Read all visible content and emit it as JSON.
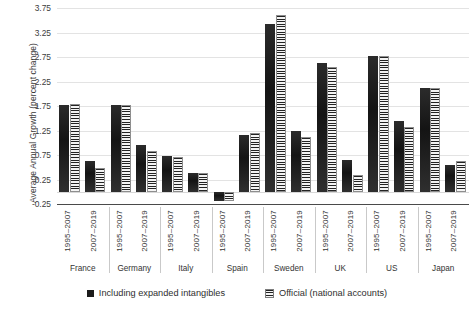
{
  "chart_data": {
    "type": "bar",
    "title": "",
    "xlabel": "",
    "ylabel": "Average Annual Growth (percent change)",
    "ylim": [
      -0.25,
      3.75
    ],
    "ytick_step": 0.5,
    "yticks": [
      "3.75",
      "3.25",
      "2.75",
      "2.25",
      "1.75",
      "1.25",
      "0.75",
      "0.25",
      "-0.25"
    ],
    "ytick_values": [
      3.75,
      3.25,
      2.75,
      2.25,
      1.75,
      1.25,
      0.75,
      0.25,
      -0.25
    ],
    "grid": true,
    "legend_position": "bottom",
    "group_label": "country",
    "categories": [
      "France 1995–2007",
      "France 2007–2019",
      "Germany 1995–2007",
      "Germany 2007–2019",
      "Italy 1995–2007",
      "Italy 2007–2019",
      "Spain 1995–2007",
      "Spain 2007–2019",
      "Sweden 1995–2007",
      "Sweden 2007–2019",
      "UK 1995–2007",
      "UK 2007–2019",
      "US 1995–2007",
      "US 2007–2019",
      "Japan 1995–2007",
      "Japan 2007–2019"
    ],
    "countries": [
      "France",
      "Germany",
      "Italy",
      "Spain",
      "Sweden",
      "UK",
      "US",
      "Japan"
    ],
    "periods": [
      "1995–2007",
      "2007–2019"
    ],
    "series": [
      {
        "name": "Including expanded intangibles",
        "style": "solid",
        "color": "#1b1b1b",
        "values": [
          1.78,
          0.63,
          1.78,
          0.95,
          0.72,
          0.38,
          -0.18,
          1.15,
          3.42,
          1.25,
          2.62,
          0.65,
          2.78,
          1.45,
          2.12,
          0.55
        ]
      },
      {
        "name": "Official (national accounts)",
        "style": "horizontal-stripes",
        "color": "#232323",
        "values": [
          1.8,
          0.48,
          1.78,
          0.83,
          0.7,
          0.38,
          -0.18,
          1.2,
          3.6,
          1.12,
          2.55,
          0.35,
          2.78,
          1.32,
          2.12,
          0.62
        ]
      }
    ],
    "groups": [
      {
        "country": "France",
        "bars": [
          {
            "period": "1995–2007",
            "expanded": 1.78,
            "official": 1.8
          },
          {
            "period": "2007–2019",
            "expanded": 0.63,
            "official": 0.48
          }
        ]
      },
      {
        "country": "Germany",
        "bars": [
          {
            "period": "1995–2007",
            "expanded": 1.78,
            "official": 1.78
          },
          {
            "period": "2007–2019",
            "expanded": 0.95,
            "official": 0.83
          }
        ]
      },
      {
        "country": "Italy",
        "bars": [
          {
            "period": "1995–2007",
            "expanded": 0.72,
            "official": 0.7
          },
          {
            "period": "2007–2019",
            "expanded": 0.38,
            "official": 0.38
          }
        ]
      },
      {
        "country": "Spain",
        "bars": [
          {
            "period": "1995–2007",
            "expanded": -0.18,
            "official": -0.18
          },
          {
            "period": "2007–2019",
            "expanded": 1.15,
            "official": 1.2
          }
        ]
      },
      {
        "country": "Sweden",
        "bars": [
          {
            "period": "1995–2007",
            "expanded": 3.42,
            "official": 3.6
          },
          {
            "period": "2007–2019",
            "expanded": 1.25,
            "official": 1.12
          }
        ]
      },
      {
        "country": "UK",
        "bars": [
          {
            "period": "1995–2007",
            "expanded": 2.62,
            "official": 2.55
          },
          {
            "period": "2007–2019",
            "expanded": 0.65,
            "official": 0.35
          }
        ]
      },
      {
        "country": "US",
        "bars": [
          {
            "period": "1995–2007",
            "expanded": 2.78,
            "official": 2.78
          },
          {
            "period": "2007–2019",
            "expanded": 1.45,
            "official": 1.32
          }
        ]
      },
      {
        "country": "Japan",
        "bars": [
          {
            "period": "1995–2007",
            "expanded": 2.12,
            "official": 2.12
          },
          {
            "period": "2007–2019",
            "expanded": 0.55,
            "official": 0.62
          }
        ]
      }
    ],
    "legend": [
      {
        "label": "Including expanded intangibles",
        "style": "solid"
      },
      {
        "label": "Official (national accounts)",
        "style": "horizontal-stripes"
      }
    ]
  }
}
